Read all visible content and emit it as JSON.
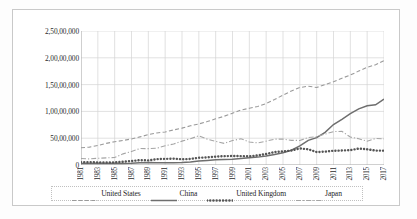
{
  "chart_data": {
    "type": "line",
    "title": "",
    "xlabel": "",
    "ylabel": "",
    "grid": true,
    "legend_position": "bottom",
    "xlim": [
      1981,
      2017
    ],
    "ylim": [
      0,
      25000000
    ],
    "y_ticks": [
      0,
      5000000,
      10000000,
      15000000,
      20000000,
      25000000
    ],
    "y_tick_labels": [
      "0",
      "50,00,000",
      "1,00,00,000",
      "1,50,00,000",
      "2,00,00,000",
      "2,50,00,000"
    ],
    "x_tick_labels": [
      "1981",
      "1983",
      "1985",
      "1987",
      "1989",
      "1991",
      "1993",
      "1995",
      "1997",
      "1999",
      "2001",
      "2003",
      "2005",
      "2007",
      "2009",
      "2011",
      "2013",
      "2015",
      "2017"
    ],
    "x": [
      1981,
      1982,
      1983,
      1984,
      1985,
      1986,
      1987,
      1988,
      1989,
      1990,
      1991,
      1992,
      1993,
      1994,
      1995,
      1996,
      1997,
      1998,
      1999,
      2000,
      2001,
      2002,
      2003,
      2004,
      2005,
      2006,
      2007,
      2008,
      2009,
      2010,
      2011,
      2012,
      2013,
      2014,
      2015,
      2016,
      2017
    ],
    "series": [
      {
        "name": "United States",
        "line_style": "dashed",
        "color": "#9a9a9a",
        "values": [
          3210000,
          3340000,
          3630000,
          4040000,
          4340000,
          4580000,
          4860000,
          5250000,
          5660000,
          5980000,
          6170000,
          6540000,
          6880000,
          7310000,
          7660000,
          8100000,
          8610000,
          9090000,
          9660000,
          10250000,
          10580000,
          10930000,
          11460000,
          12210000,
          13040000,
          13810000,
          14450000,
          14710000,
          14450000,
          15000000,
          15540000,
          16200000,
          16780000,
          17520000,
          18220000,
          18700000,
          19480000
        ]
      },
      {
        "name": "China",
        "line_style": "solid",
        "color": "#6e6e6e",
        "values": [
          290000,
          280000,
          310000,
          260000,
          310000,
          300000,
          330000,
          410000,
          460000,
          400000,
          410000,
          430000,
          450000,
          560000,
          740000,
          860000,
          960000,
          1030000,
          1090000,
          1210000,
          1340000,
          1470000,
          1660000,
          1960000,
          2290000,
          2750000,
          3550000,
          4600000,
          5110000,
          6090000,
          7550000,
          8530000,
          9570000,
          10480000,
          11060000,
          11230000,
          12310000
        ]
      },
      {
        "name": "United Kingdom",
        "line_style": "dotted",
        "color": "#555555",
        "values": [
          540000,
          520000,
          490000,
          470000,
          490000,
          600000,
          740000,
          910000,
          860000,
          1090000,
          1140000,
          1180000,
          1060000,
          1140000,
          1340000,
          1420000,
          1560000,
          1650000,
          1680000,
          1660000,
          1630000,
          1790000,
          2050000,
          2420000,
          2530000,
          2710000,
          3090000,
          2930000,
          2410000,
          2490000,
          2660000,
          2700000,
          2780000,
          3060000,
          2930000,
          2690000,
          2680000
        ]
      },
      {
        "name": "Japan",
        "line_style": "dash-dot",
        "color": "#a5a5a5",
        "values": [
          1220000,
          1130000,
          1260000,
          1330000,
          1400000,
          2080000,
          2530000,
          3070000,
          3050000,
          3130000,
          3580000,
          3910000,
          4450000,
          4910000,
          5450000,
          4830000,
          4410000,
          4040000,
          4560000,
          4890000,
          4300000,
          4120000,
          4450000,
          4820000,
          4830000,
          4600000,
          4580000,
          5110000,
          5290000,
          5760000,
          6230000,
          6270000,
          5210000,
          4900000,
          4440000,
          4950000,
          4870000
        ]
      }
    ]
  },
  "legend": {
    "items": [
      {
        "label": "United States"
      },
      {
        "label": "China"
      },
      {
        "label": "United Kingdom"
      },
      {
        "label": "Japan"
      }
    ]
  }
}
